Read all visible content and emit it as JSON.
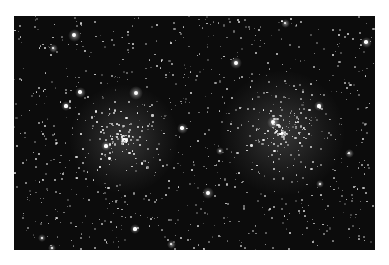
{
  "image": {
    "subject": "star field with two open star clusters",
    "background_color": "#ffffff",
    "field_color": "#0c0c0c",
    "field": {
      "x": 14,
      "y": 16,
      "width": 361,
      "height": 234
    }
  },
  "clusters": [
    {
      "name": "left-cluster",
      "cx": 110,
      "cy": 123,
      "r": 45
    },
    {
      "name": "right-cluster",
      "cx": 268,
      "cy": 117,
      "r": 52
    }
  ],
  "bright_stars": [
    {
      "x": 60,
      "y": 19,
      "r": 2.6
    },
    {
      "x": 122,
      "y": 77,
      "r": 2.8
    },
    {
      "x": 66,
      "y": 76,
      "r": 2.2
    },
    {
      "x": 222,
      "y": 47,
      "r": 2.4
    },
    {
      "x": 168,
      "y": 112,
      "r": 2.2
    },
    {
      "x": 194,
      "y": 177,
      "r": 2.4
    },
    {
      "x": 259,
      "y": 106,
      "r": 2.6
    },
    {
      "x": 352,
      "y": 26,
      "r": 2.2
    },
    {
      "x": 121,
      "y": 213,
      "r": 2.0
    },
    {
      "x": 39,
      "y": 32,
      "r": 1.8
    },
    {
      "x": 271,
      "y": 7,
      "r": 1.8
    },
    {
      "x": 52,
      "y": 90,
      "r": 1.9
    },
    {
      "x": 92,
      "y": 130,
      "r": 1.9
    },
    {
      "x": 305,
      "y": 90,
      "r": 1.9
    },
    {
      "x": 335,
      "y": 137,
      "r": 1.8
    },
    {
      "x": 306,
      "y": 168,
      "r": 1.7
    },
    {
      "x": 206,
      "y": 135,
      "r": 1.6
    },
    {
      "x": 28,
      "y": 222,
      "r": 1.6
    },
    {
      "x": 38,
      "y": 232,
      "r": 1.7
    },
    {
      "x": 157,
      "y": 228,
      "r": 1.8
    }
  ],
  "faint_star_count": 900,
  "cluster_star_count": 120
}
